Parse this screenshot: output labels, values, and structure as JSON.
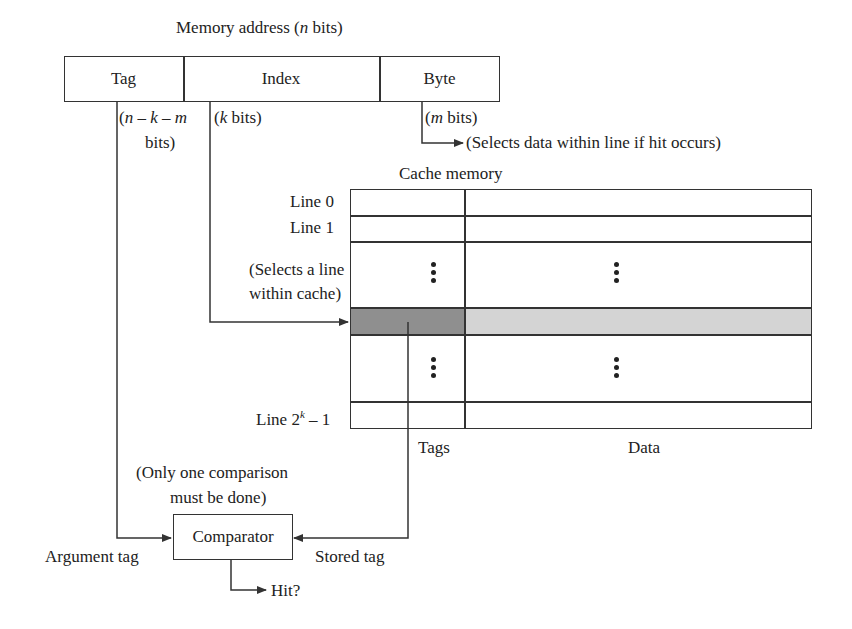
{
  "address": {
    "title": "Memory address (n bits)",
    "title_prefix": "Memory address (",
    "title_var": "n",
    "title_suffix": " bits)",
    "fields": [
      {
        "label": "Tag",
        "bits_label": "(n − k − m bits)"
      },
      {
        "label": "Index",
        "bits_label": "(k bits)"
      },
      {
        "label": "Byte",
        "bits_label": "(m bits)"
      }
    ],
    "tag_bits_line1_a": "(",
    "tag_bits_n": "n",
    "tag_bits_mid1": " – ",
    "tag_bits_k": "k",
    "tag_bits_mid2": " – ",
    "tag_bits_m": "m",
    "tag_bits_line2": "bits)",
    "index_bits_pre": "(",
    "index_bits_var": "k",
    "index_bits_post": " bits)",
    "byte_bits_pre": "(",
    "byte_bits_var": "m",
    "byte_bits_post": " bits)",
    "byte_note": "(Selects data within line if hit occurs)"
  },
  "cache": {
    "title": "Cache memory",
    "lines": [
      "Line 0",
      "Line 1"
    ],
    "last_line_prefix": "Line 2",
    "last_line_sup": "k",
    "last_line_suffix": " – 1",
    "select_note_line1": "(Selects a line",
    "select_note_line2": "within cache)",
    "columns": {
      "tags": "Tags",
      "data": "Data"
    },
    "colors": {
      "selected_tag": "#8f8f8f",
      "selected_data": "#d4d4d4",
      "line": "#333333"
    }
  },
  "comparator": {
    "label": "Comparator",
    "note_line1": "(Only one comparison",
    "note_line2": "must be done)",
    "argument_tag": "Argument tag",
    "stored_tag": "Stored tag",
    "output": "Hit?"
  }
}
